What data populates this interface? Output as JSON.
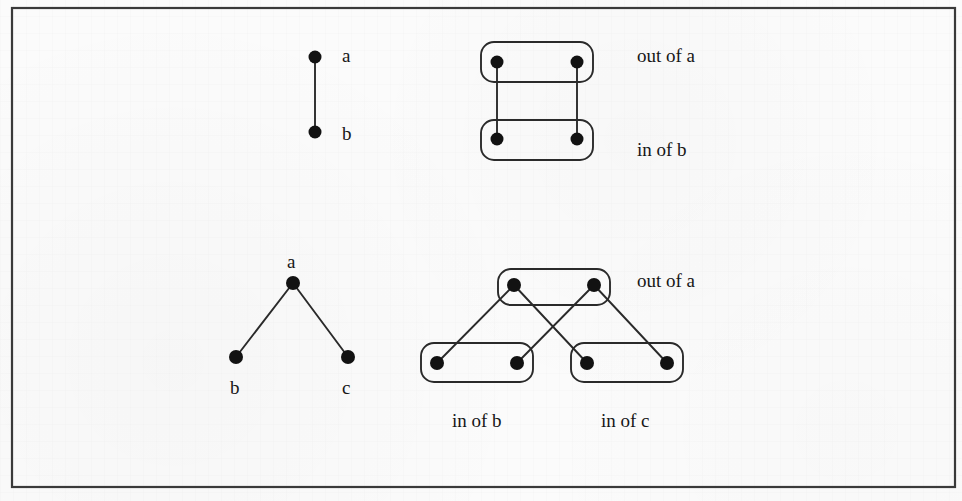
{
  "figure": {
    "background_color": "#fbfbfb",
    "ink_color": "#1b1b1b",
    "frame": {
      "x": 12,
      "y": 8,
      "width": 943,
      "height": 479
    }
  },
  "panels": [
    {
      "id": "top-left-graph",
      "name": "single-edge-graph",
      "description": "A vertical edge from node a down to node b",
      "nodes": [
        {
          "id": "a",
          "label": "a",
          "cx": 315,
          "cy": 57,
          "r": 6.5,
          "label_x": 342,
          "label_y": 62
        },
        {
          "id": "b",
          "label": "b",
          "cx": 315,
          "cy": 132,
          "r": 6.5,
          "label_x": 342,
          "label_y": 140
        }
      ],
      "edges": [
        {
          "from": "a",
          "to": "b"
        }
      ]
    },
    {
      "id": "top-right-expansion",
      "name": "single-edge-expansion",
      "description": "Out-of-a group connected to in-of-b group by two parallel edges",
      "groups": [
        {
          "id": "out-a",
          "label": "out of a",
          "x": 481,
          "y": 42,
          "width": 112,
          "height": 40,
          "rx": 13,
          "label_x": 637,
          "label_y": 62
        },
        {
          "id": "in-b",
          "label": "in of b",
          "x": 481,
          "y": 120,
          "width": 112,
          "height": 40,
          "rx": 13,
          "label_x": 637,
          "label_y": 156
        }
      ],
      "nodes": [
        {
          "id": "out-a-1",
          "cx": 497,
          "cy": 62,
          "r": 6.5
        },
        {
          "id": "out-a-2",
          "cx": 577,
          "cy": 62,
          "r": 6.5
        },
        {
          "id": "in-b-1",
          "cx": 497,
          "cy": 139,
          "r": 6.5
        },
        {
          "id": "in-b-2",
          "cx": 577,
          "cy": 139,
          "r": 6.5
        }
      ],
      "edges": [
        {
          "from": "out-a-1",
          "to": "in-b-1"
        },
        {
          "from": "out-a-2",
          "to": "in-b-2"
        }
      ]
    },
    {
      "id": "bottom-left-graph",
      "name": "two-edge-tree-graph",
      "description": "Root node a with two child nodes b and c",
      "nodes": [
        {
          "id": "a",
          "label": "a",
          "cx": 293,
          "cy": 283,
          "r": 7,
          "label_x": 287,
          "label_y": 268
        },
        {
          "id": "b",
          "label": "b",
          "cx": 236,
          "cy": 357,
          "r": 7,
          "label_x": 230,
          "label_y": 394
        },
        {
          "id": "c",
          "label": "c",
          "cx": 348,
          "cy": 357,
          "r": 7,
          "label_x": 342,
          "label_y": 394
        }
      ],
      "edges": [
        {
          "from": "a",
          "to": "b"
        },
        {
          "from": "a",
          "to": "c"
        }
      ]
    },
    {
      "id": "bottom-right-expansion",
      "name": "two-edge-expansion",
      "description": "Out-of-a group feeding crossing edges into in-of-b and in-of-c groups",
      "groups": [
        {
          "id": "out-a",
          "label": "out of a",
          "x": 498,
          "y": 269,
          "width": 112,
          "height": 36,
          "rx": 13,
          "label_x": 637,
          "label_y": 287
        },
        {
          "id": "in-b",
          "label": "in of b",
          "x": 421,
          "y": 343,
          "width": 112,
          "height": 39,
          "rx": 13,
          "label_x": 452,
          "label_y": 427
        },
        {
          "id": "in-c",
          "label": "in of c",
          "x": 571,
          "y": 343,
          "width": 112,
          "height": 39,
          "rx": 13,
          "label_x": 601,
          "label_y": 427
        }
      ],
      "nodes": [
        {
          "id": "out-a-1",
          "cx": 514,
          "cy": 285,
          "r": 7
        },
        {
          "id": "out-a-2",
          "cx": 594,
          "cy": 285,
          "r": 7
        },
        {
          "id": "in-b-1",
          "cx": 437,
          "cy": 363,
          "r": 7
        },
        {
          "id": "in-b-2",
          "cx": 517,
          "cy": 363,
          "r": 7
        },
        {
          "id": "in-c-1",
          "cx": 587,
          "cy": 363,
          "r": 7
        },
        {
          "id": "in-c-2",
          "cx": 667,
          "cy": 363,
          "r": 7
        }
      ],
      "edges": [
        {
          "from": "out-a-1",
          "to": "in-b-1"
        },
        {
          "from": "out-a-1",
          "to": "in-c-1"
        },
        {
          "from": "out-a-2",
          "to": "in-b-2"
        },
        {
          "from": "out-a-2",
          "to": "in-c-2"
        }
      ]
    }
  ],
  "labels": {
    "node_a_top": "a",
    "node_b_top": "b",
    "node_a_bottom": "a",
    "node_b_bottom": "b",
    "node_c_bottom": "c",
    "out_of_a_top": "out of a",
    "in_of_b_top": "in of b",
    "out_of_a_bottom": "out of a",
    "in_of_b_bottom": "in of b",
    "in_of_c_bottom": "in of c"
  }
}
